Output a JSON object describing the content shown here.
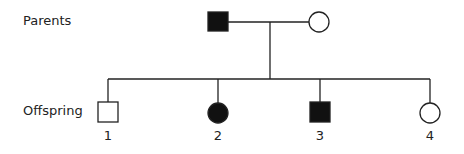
{
  "labels": {
    "parents": "Parents",
    "offspring": "Offspring"
  },
  "parents": [
    {
      "sex": "male",
      "affected": true
    },
    {
      "sex": "female",
      "affected": false
    }
  ],
  "offspring": [
    {
      "number": "1",
      "sex": "male",
      "affected": false
    },
    {
      "number": "2",
      "sex": "female",
      "affected": true
    },
    {
      "number": "3",
      "sex": "male",
      "affected": true
    },
    {
      "number": "4",
      "sex": "female",
      "affected": false
    }
  ],
  "colors": {
    "affected": "#111111",
    "unaffected": "#ffffff",
    "line": "#222222"
  }
}
